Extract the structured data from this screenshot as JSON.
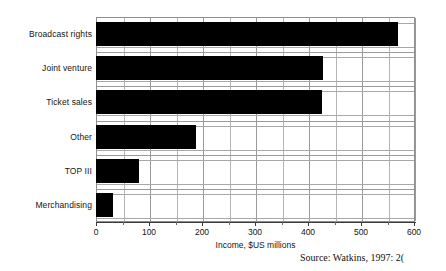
{
  "chart_data": {
    "type": "bar",
    "orientation": "horizontal",
    "title": "",
    "xlabel": "Income, $US millions",
    "ylabel": "",
    "categories": [
      "Broadcast rights",
      "Joint venture",
      "Ticket sales",
      "Other",
      "TOP III",
      "Merchandising"
    ],
    "values": [
      570,
      428,
      427,
      188,
      82,
      33
    ],
    "xlim": [
      0,
      600
    ],
    "xticks": [
      0,
      100,
      200,
      300,
      400,
      500,
      600
    ],
    "xtick_labels": [
      "0",
      "100",
      "200",
      "300",
      "400",
      "500",
      "600"
    ],
    "minor_tick_interval": 50,
    "grid": "vertical-and-horizontal",
    "legend": "none",
    "bar_color": "#000000",
    "grid_color": "#9a9a9a",
    "background_color": "#ffffff"
  },
  "annotations": {
    "source": "Source:  Watkins, 1997: 2("
  }
}
